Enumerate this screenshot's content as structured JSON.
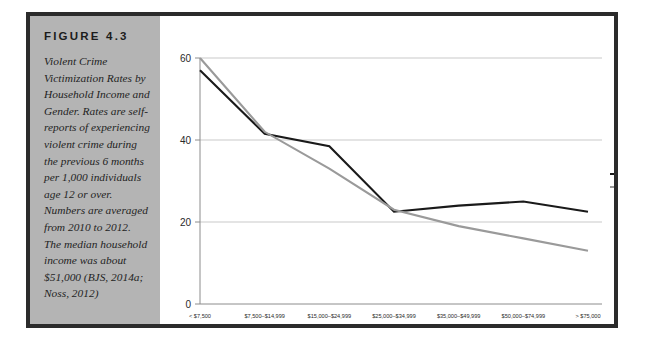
{
  "figure": {
    "heading": "FIGURE 4.3",
    "caption": "Violent Crime Victimization Rates by Household Income and Gender. Rates are self-reports of experiencing violent crime during the previous 6 months per 1,000 individuals age 12 or over. Numbers are averaged from 2010 to 2012. The median household income was about $51,000 (BJS, 2014a; Noss, 2012)"
  },
  "colors": {
    "men": "#1a1a1a",
    "women": "#9a9a9a",
    "gridline": "#c9c9c9",
    "axis": "#8c8c8c",
    "panel_background": "#b4b4b4",
    "frame_border": "#2b2b2b",
    "plot_background": "#ffffff"
  },
  "chart_data": {
    "type": "line",
    "title": "",
    "xlabel": "",
    "ylabel": "",
    "ylim": [
      0,
      60
    ],
    "yticks": [
      0,
      20,
      40,
      60
    ],
    "ytick_labels": [
      "0",
      "20",
      "40",
      "60"
    ],
    "grid": true,
    "legend_position": "right",
    "categories": [
      "< $7,500",
      "$7,500–$14,999",
      "$15,000–$24,999",
      "$25,000–$34,999",
      "$35,000–$49,999",
      "$50,000–$74,999",
      "> $75,000"
    ],
    "series": [
      {
        "name": "Men",
        "color": "#1a1a1a",
        "values": [
          57,
          41.5,
          38.5,
          22.5,
          24,
          25,
          22.5
        ]
      },
      {
        "name": "Women",
        "color": "#9a9a9a",
        "values": [
          60,
          42,
          33,
          23,
          19,
          16,
          13
        ]
      }
    ]
  }
}
